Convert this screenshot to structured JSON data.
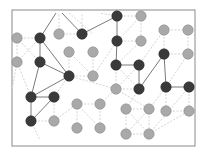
{
  "diagram": {
    "type": "network-graph",
    "frame": {
      "x": 12,
      "y": 10,
      "width": 183,
      "height": 136,
      "stroke": "#8a8a8a"
    },
    "colors": {
      "dark_node": "#3a3a3a",
      "light_node": "#a9a9a9",
      "node_stroke": "#8c8c8c",
      "strong_edge": "#7a7a7a",
      "weak_edge": "#d4d4d4"
    },
    "nodes": [
      {
        "id": "n1",
        "x": 17,
        "y": 38,
        "kind": "light"
      },
      {
        "id": "n2",
        "x": 40,
        "y": 38,
        "kind": "dark"
      },
      {
        "id": "n3",
        "x": 59,
        "y": 34,
        "kind": "light"
      },
      {
        "id": "n4",
        "x": 82,
        "y": 34,
        "kind": "dark"
      },
      {
        "id": "n5",
        "x": 117,
        "y": 16,
        "kind": "dark"
      },
      {
        "id": "n6",
        "x": 141,
        "y": 16,
        "kind": "light"
      },
      {
        "id": "n7",
        "x": 17,
        "y": 62,
        "kind": "light"
      },
      {
        "id": "n8",
        "x": 40,
        "y": 62,
        "kind": "dark"
      },
      {
        "id": "n9",
        "x": 69,
        "y": 52,
        "kind": "light"
      },
      {
        "id": "n10",
        "x": 93,
        "y": 52,
        "kind": "light"
      },
      {
        "id": "n11",
        "x": 117,
        "y": 41,
        "kind": "dark"
      },
      {
        "id": "n12",
        "x": 141,
        "y": 41,
        "kind": "light"
      },
      {
        "id": "n13",
        "x": 164,
        "y": 30,
        "kind": "light"
      },
      {
        "id": "n14",
        "x": 188,
        "y": 30,
        "kind": "light"
      },
      {
        "id": "n15",
        "x": 164,
        "y": 54,
        "kind": "dark"
      },
      {
        "id": "n16",
        "x": 188,
        "y": 54,
        "kind": "light"
      },
      {
        "id": "n17",
        "x": 69,
        "y": 76,
        "kind": "dark"
      },
      {
        "id": "n18",
        "x": 93,
        "y": 76,
        "kind": "light"
      },
      {
        "id": "n19",
        "x": 116,
        "y": 65,
        "kind": "dark"
      },
      {
        "id": "n20",
        "x": 139,
        "y": 65,
        "kind": "dark"
      },
      {
        "id": "n21",
        "x": 116,
        "y": 89,
        "kind": "light"
      },
      {
        "id": "n22",
        "x": 139,
        "y": 89,
        "kind": "dark"
      },
      {
        "id": "n23",
        "x": 166,
        "y": 87,
        "kind": "dark"
      },
      {
        "id": "n24",
        "x": 189,
        "y": 87,
        "kind": "dark"
      },
      {
        "id": "n25",
        "x": 31,
        "y": 97,
        "kind": "dark"
      },
      {
        "id": "n26",
        "x": 54,
        "y": 97,
        "kind": "dark"
      },
      {
        "id": "n27",
        "x": 31,
        "y": 121,
        "kind": "dark"
      },
      {
        "id": "n28",
        "x": 54,
        "y": 121,
        "kind": "light"
      },
      {
        "id": "n29",
        "x": 77,
        "y": 104,
        "kind": "light"
      },
      {
        "id": "n30",
        "x": 100,
        "y": 104,
        "kind": "light"
      },
      {
        "id": "n31",
        "x": 77,
        "y": 128,
        "kind": "light"
      },
      {
        "id": "n32",
        "x": 100,
        "y": 128,
        "kind": "light"
      },
      {
        "id": "n33",
        "x": 126,
        "y": 109,
        "kind": "light"
      },
      {
        "id": "n34",
        "x": 149,
        "y": 109,
        "kind": "light"
      },
      {
        "id": "n35",
        "x": 166,
        "y": 111,
        "kind": "light"
      },
      {
        "id": "n36",
        "x": 189,
        "y": 111,
        "kind": "light"
      },
      {
        "id": "n37",
        "x": 126,
        "y": 134,
        "kind": "light"
      },
      {
        "id": "n38",
        "x": 149,
        "y": 134,
        "kind": "light"
      }
    ],
    "strong_edges": [
      [
        40,
        38,
        40,
        62
      ],
      [
        40,
        38,
        69,
        76
      ],
      [
        40,
        62,
        69,
        76
      ],
      [
        40,
        38,
        56,
        13
      ],
      [
        82,
        34,
        62,
        13
      ],
      [
        82,
        34,
        117,
        16
      ],
      [
        69,
        76,
        31,
        97
      ],
      [
        40,
        62,
        31,
        97
      ],
      [
        31,
        97,
        54,
        97
      ],
      [
        31,
        97,
        31,
        121
      ],
      [
        54,
        97,
        31,
        121
      ],
      [
        117,
        16,
        117,
        41
      ],
      [
        117,
        41,
        116,
        65
      ],
      [
        116,
        65,
        139,
        65
      ],
      [
        139,
        65,
        139,
        89
      ],
      [
        164,
        54,
        139,
        89
      ],
      [
        164,
        54,
        166,
        87
      ],
      [
        166,
        87,
        189,
        87
      ]
    ],
    "weak_edges": [
      [
        17,
        38,
        40,
        38
      ],
      [
        17,
        38,
        17,
        62
      ],
      [
        17,
        38,
        40,
        62
      ],
      [
        17,
        62,
        40,
        38
      ],
      [
        17,
        62,
        31,
        97
      ],
      [
        59,
        34,
        82,
        34
      ],
      [
        59,
        34,
        59,
        13
      ],
      [
        82,
        34,
        82,
        13
      ],
      [
        69,
        13,
        93,
        34
      ],
      [
        69,
        52,
        69,
        76
      ],
      [
        69,
        52,
        93,
        76
      ],
      [
        93,
        52,
        93,
        76
      ],
      [
        69,
        76,
        93,
        76
      ],
      [
        69,
        76,
        116,
        89
      ],
      [
        93,
        76,
        117,
        41
      ],
      [
        117,
        16,
        141,
        16
      ],
      [
        117,
        16,
        100,
        13
      ],
      [
        141,
        16,
        141,
        41
      ],
      [
        141,
        16,
        117,
        41
      ],
      [
        117,
        41,
        141,
        41
      ],
      [
        141,
        41,
        116,
        65
      ],
      [
        164,
        30,
        188,
        30
      ],
      [
        164,
        30,
        164,
        54
      ],
      [
        188,
        30,
        188,
        54
      ],
      [
        164,
        30,
        139,
        65
      ],
      [
        164,
        54,
        188,
        54
      ],
      [
        188,
        54,
        166,
        87
      ],
      [
        116,
        65,
        116,
        89
      ],
      [
        116,
        65,
        139,
        89
      ],
      [
        139,
        65,
        116,
        89
      ],
      [
        116,
        89,
        139,
        89
      ],
      [
        139,
        89,
        126,
        109
      ],
      [
        116,
        89,
        149,
        109
      ],
      [
        166,
        87,
        166,
        111
      ],
      [
        189,
        87,
        189,
        111
      ],
      [
        166,
        111,
        189,
        111
      ],
      [
        189,
        87,
        149,
        134
      ],
      [
        54,
        97,
        54,
        121
      ],
      [
        31,
        121,
        54,
        121
      ],
      [
        54,
        97,
        69,
        76
      ],
      [
        54,
        121,
        77,
        104
      ],
      [
        77,
        104,
        100,
        104
      ],
      [
        77,
        104,
        77,
        128
      ],
      [
        100,
        104,
        100,
        128
      ],
      [
        77,
        104,
        100,
        128
      ],
      [
        100,
        104,
        116,
        89
      ],
      [
        126,
        109,
        149,
        109
      ],
      [
        126,
        109,
        126,
        134
      ],
      [
        149,
        109,
        149,
        134
      ],
      [
        126,
        109,
        149,
        134
      ],
      [
        149,
        109,
        126,
        134
      ],
      [
        126,
        134,
        149,
        134
      ],
      [
        149,
        134,
        189,
        111
      ],
      [
        149,
        109,
        166,
        87
      ],
      [
        17,
        62,
        12,
        90
      ],
      [
        31,
        121,
        40,
        140
      ]
    ]
  }
}
